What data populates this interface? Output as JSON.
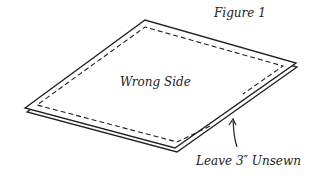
{
  "figure": {
    "title": "Figure 1",
    "center_label": "Wrong Side",
    "annotation": "Leave 3″ Unsewn"
  },
  "colors": {
    "ink": "#222222",
    "background": "#ffffff"
  }
}
